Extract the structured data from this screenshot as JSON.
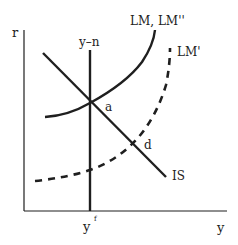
{
  "diagram": {
    "type": "IS-LM economic diagram",
    "axes": {
      "y_axis_label": "r",
      "x_axis_label": "y",
      "x_tick_label": "y",
      "x_tick_superscript": "f"
    },
    "curves": {
      "vertical_line_label": "y–n",
      "lm_label": "LM, LM''",
      "lm_prime_label": "LM'",
      "is_label": "IS"
    },
    "points": {
      "a_label": "a",
      "d_label": "d"
    },
    "colors": {
      "line": "#1f1f1f",
      "text": "#222222",
      "background": "#ffffff"
    }
  }
}
